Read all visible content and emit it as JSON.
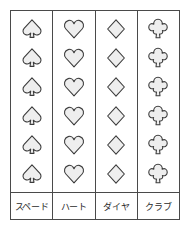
{
  "figure": {
    "rows_per_column": 6,
    "colors": {
      "border": "#4a4a4a",
      "symbol_outline": "#3c3c3c",
      "symbol_fill": "#eeeeee",
      "background": "#ffffff",
      "label_text": "#2b2b2b"
    }
  },
  "columns": [
    {
      "id": "spade",
      "icon": "spade-icon",
      "label": "スペード",
      "symbols": [
        "spade",
        "spade",
        "spade",
        "spade",
        "spade",
        "spade"
      ]
    },
    {
      "id": "heart",
      "icon": "heart-icon",
      "label": "ハート",
      "symbols": [
        "heart",
        "heart",
        "heart",
        "heart",
        "heart",
        "heart"
      ]
    },
    {
      "id": "diamond",
      "icon": "diamond-icon",
      "label": "ダイヤ",
      "symbols": [
        "diamond",
        "diamond",
        "diamond",
        "diamond",
        "diamond",
        "diamond"
      ]
    },
    {
      "id": "club",
      "icon": "club-icon",
      "label": "クラブ",
      "symbols": [
        "club",
        "club",
        "club",
        "club",
        "club",
        "club"
      ]
    }
  ]
}
